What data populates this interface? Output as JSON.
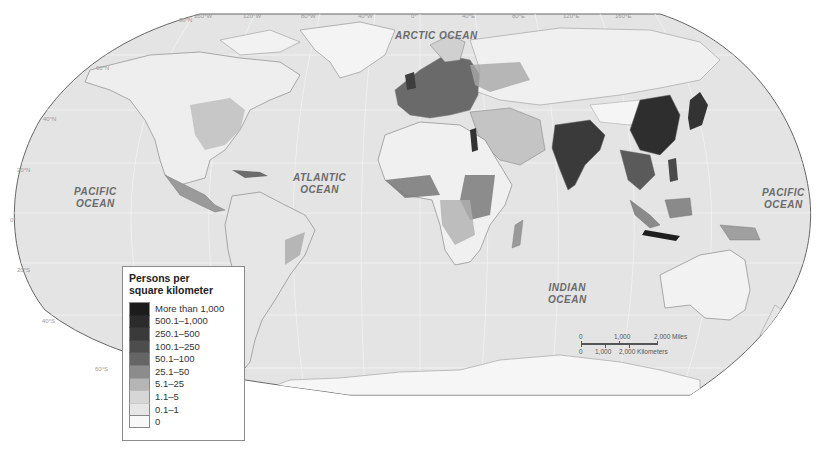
{
  "map": {
    "title": "World population density",
    "projection": "Robinson",
    "ocean_labels": {
      "arctic": "ARCTIC OCEAN",
      "atlantic_line1": "ATLANTIC",
      "atlantic_line2": "OCEAN",
      "pacific_west_line1": "PACIFIC",
      "pacific_west_line2": "OCEAN",
      "pacific_east_line1": "PACIFIC",
      "pacific_east_line2": "OCEAN",
      "indian_line1": "INDIAN",
      "indian_line2": "OCEAN"
    },
    "longitude_labels": [
      "160°W",
      "120°W",
      "80°W",
      "40°W",
      "0°",
      "40°E",
      "80°E",
      "120°E",
      "160°E"
    ],
    "latitude_labels": [
      "80°N",
      "60°N",
      "40°N",
      "20°N",
      "0°",
      "20°S",
      "40°S",
      "60°S"
    ],
    "colors": {
      "ocean": "#e4e4e4",
      "land_base": "#f3f3f3",
      "border": "#7a7a7a",
      "frame": "#666666"
    }
  },
  "legend": {
    "title_line1": "Persons per",
    "title_line2": "square kilometer",
    "classes": [
      {
        "label": "More than 1,000",
        "color": "#1c1c1c"
      },
      {
        "label": "500.1–1,000",
        "color": "#2b2b2b"
      },
      {
        "label": "250.1–500",
        "color": "#3a3a3a"
      },
      {
        "label": "100.1–250",
        "color": "#4d4d4d"
      },
      {
        "label": "50.1–100",
        "color": "#656565"
      },
      {
        "label": "25.1–50",
        "color": "#8c8c8c"
      },
      {
        "label": "5.1–25",
        "color": "#b5b5b5"
      },
      {
        "label": "1.1–5",
        "color": "#d6d6d6"
      },
      {
        "label": "0.1–1",
        "color": "#e6e6e6"
      },
      {
        "label": "0",
        "color": "#f8f8f8"
      }
    ]
  },
  "scale_bar": {
    "miles_ticks": [
      "0",
      "1,000",
      "2,000 Miles"
    ],
    "km_ticks": [
      "0",
      "1,000",
      "2,000 Kilometers"
    ]
  }
}
